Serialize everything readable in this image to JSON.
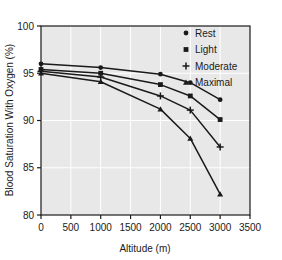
{
  "chart_data": {
    "type": "line",
    "title": "",
    "xlabel": "Altitude (m)",
    "ylabel": "Blood Saturation With Oxygen (%)",
    "xlim": [
      0,
      3500
    ],
    "ylim": [
      80,
      100
    ],
    "xticks": [
      0,
      500,
      1000,
      1500,
      2000,
      2500,
      3000,
      3500
    ],
    "yticks": [
      80,
      85,
      90,
      95,
      100
    ],
    "xtick_labels": [
      "0",
      "500",
      "1000",
      "1500",
      "2000",
      "2500",
      "3000",
      "3500"
    ],
    "ytick_labels": [
      "80",
      "85",
      "90",
      "95",
      "100"
    ],
    "grid": true,
    "legend_position": "top-right",
    "x": [
      0,
      1000,
      2000,
      2500,
      3000
    ],
    "series": [
      {
        "name": "Rest",
        "marker": "circle",
        "values": [
          96.0,
          95.6,
          94.9,
          94.0,
          92.2
        ]
      },
      {
        "name": "Light",
        "marker": "square",
        "values": [
          95.4,
          95.0,
          93.8,
          92.6,
          90.1
        ]
      },
      {
        "name": "Moderate",
        "marker": "plus",
        "values": [
          95.2,
          94.6,
          92.6,
          91.1,
          87.2
        ]
      },
      {
        "name": "Maximal",
        "marker": "triangle",
        "values": [
          95.0,
          94.1,
          91.2,
          88.1,
          82.2
        ]
      }
    ],
    "colors": {
      "plot_background": "#e8e8e8",
      "grid": "#ffffff",
      "axis": "#1a1a1a",
      "series": "#1a1a1a",
      "figure_background": "#ffffff"
    }
  },
  "legend": {
    "items": [
      {
        "label": "Rest",
        "marker": "circle"
      },
      {
        "label": "Light",
        "marker": "square"
      },
      {
        "label": "Moderate",
        "marker": "plus"
      },
      {
        "label": "Maximal",
        "marker": "triangle"
      }
    ]
  },
  "axes": {
    "x_label": "Altitude (m)",
    "y_label": "Blood Saturation With Oxygen (%)"
  }
}
